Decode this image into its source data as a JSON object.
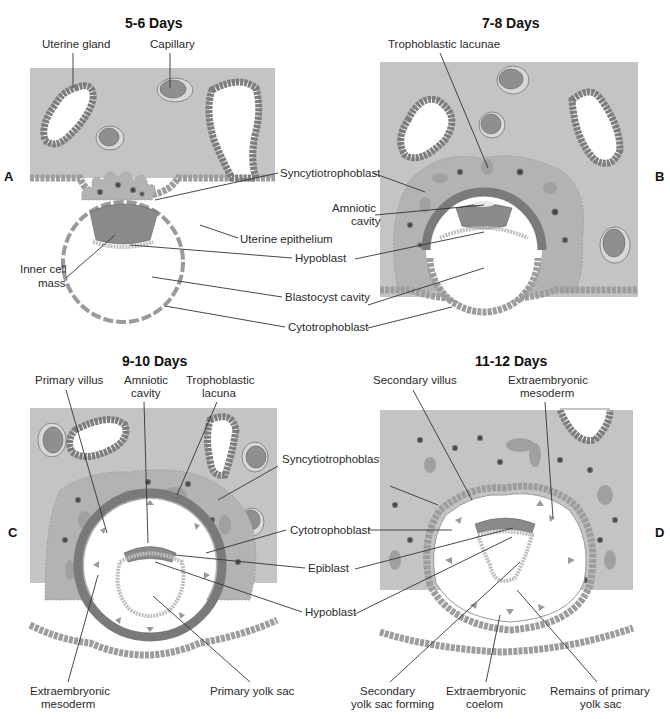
{
  "figure": {
    "panels": [
      {
        "id": "A",
        "letter": "A",
        "title": "5-6 Days",
        "labels": {
          "uterine_gland": "Uterine gland",
          "capillary": "Capillary",
          "syncytiotrophoblast": "Syncytiotrophoblast",
          "uterine_epithelium": "Uterine epithelium",
          "hypoblast": "Hypoblast",
          "inner_cell_mass_1": "Inner cell",
          "inner_cell_mass_2": "mass",
          "blastocyst_cavity": "Blastocyst cavity",
          "cytotrophoblast": "Cytotrophoblast"
        }
      },
      {
        "id": "B",
        "letter": "B",
        "title": "7-8 Days",
        "labels": {
          "trophoblastic_lacunae": "Trophoblastic lacunae",
          "amniotic_cavity_1": "Amniotic",
          "amniotic_cavity_2": "cavity"
        }
      },
      {
        "id": "C",
        "letter": "C",
        "title": "9-10 Days",
        "labels": {
          "primary_villus": "Primary villus",
          "amniotic_cavity_1": "Amniotic",
          "amniotic_cavity_2": "cavity",
          "trophoblastic_lacuna_1": "Trophoblastic",
          "trophoblastic_lacuna_2": "lacuna",
          "syncytiotrophoblast": "Syncytiotrophoblast",
          "cytotrophoblast": "Cytotrophoblast",
          "epiblast": "Epiblast",
          "hypoblast": "Hypoblast",
          "extraembryonic_mesoderm_1": "Extraembryonic",
          "extraembryonic_mesoderm_2": "mesoderm",
          "primary_yolk_sac": "Primary yolk sac"
        }
      },
      {
        "id": "D",
        "letter": "D",
        "title": "11-12 Days",
        "labels": {
          "secondary_villus": "Secondary villus",
          "extraembryonic_mesoderm_1": "Extraembryonic",
          "extraembryonic_mesoderm_2": "mesoderm",
          "secondary_yolk_sac_1": "Secondary",
          "secondary_yolk_sac_2": "yolk sac forming",
          "extraembryonic_coelom_1": "Extraembryonic",
          "extraembryonic_coelom_2": "coelom",
          "remains_primary_yolk_sac_1": "Remains of primary",
          "remains_primary_yolk_sac_2": "yolk sac"
        }
      }
    ],
    "colors": {
      "tissue": "#c4c4c4",
      "cell_wall": "#7a7a7a",
      "capillary_fill": "#8f8f8f",
      "background": "#ffffff",
      "text": "#2a2a2a"
    }
  }
}
